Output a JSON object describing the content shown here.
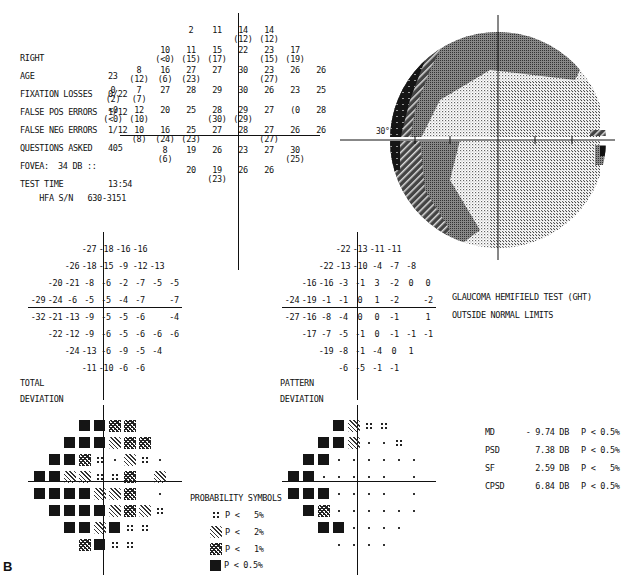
{
  "report": {
    "eye": "RIGHT",
    "figure_label": "B",
    "info": [
      {
        "label": "AGE",
        "value": "23"
      },
      {
        "label": "FIXATION LOSSES",
        "value": "0/22"
      },
      {
        "label": "FALSE POS ERRORS",
        "value": "1/12"
      },
      {
        "label": "FALSE NEG ERRORS",
        "value": "1/12"
      },
      {
        "label": "QUESTIONS ASKED",
        "value": "405"
      },
      {
        "label": "FOVEA:",
        "value": "34 DB ::"
      },
      {
        "label": "TEST TIME",
        "value": "13:54"
      }
    ],
    "serial": {
      "label": "HFA S/N",
      "value": "630-3151"
    }
  },
  "threshold": {
    "rows": [
      [
        null,
        null,
        null,
        {
          "v": "2"
        },
        {
          "v": "11"
        },
        {
          "v": "14",
          "r": "(12)"
        },
        {
          "v": "14",
          "r": "(12)"
        },
        null,
        null,
        null
      ],
      [
        null,
        null,
        {
          "v": "10",
          "r": "(<0)"
        },
        {
          "v": "11",
          "r": "(15)"
        },
        {
          "v": "15",
          "r": "(17)"
        },
        {
          "v": "22"
        },
        {
          "v": "23",
          "r": "(15)"
        },
        {
          "v": "17",
          "r": "(19)"
        },
        null,
        null
      ],
      [
        null,
        {
          "v": "8",
          "r": "(12)"
        },
        {
          "v": "16",
          "r": "(6)"
        },
        {
          "v": "27",
          "r": "(23)"
        },
        {
          "v": "27"
        },
        {
          "v": "30"
        },
        {
          "v": "23",
          "r": "(27)"
        },
        {
          "v": "26"
        },
        {
          "v": "26"
        },
        null
      ],
      [
        {
          "v": "0",
          "r": "(2)"
        },
        {
          "v": "7",
          "r": "(7)"
        },
        {
          "v": "27"
        },
        {
          "v": "28"
        },
        {
          "v": "29"
        },
        {
          "v": "30"
        },
        {
          "v": "26"
        },
        {
          "v": "23"
        },
        {
          "v": "25"
        },
        null
      ],
      [
        {
          "v": "<0",
          "r": "(<0)"
        },
        {
          "v": "12",
          "r": "(10)"
        },
        {
          "v": "20"
        },
        {
          "v": "25"
        },
        {
          "v": "28",
          "r": "(30)"
        },
        {
          "v": "29",
          "r": "(29)"
        },
        {
          "v": "27"
        },
        {
          "v": "(0"
        },
        {
          "v": "28"
        },
        null
      ],
      [
        null,
        {
          "v": "10",
          "r": "(8)"
        },
        {
          "v": "16",
          "r": "(24)"
        },
        {
          "v": "25",
          "r": "(23)"
        },
        {
          "v": "27"
        },
        {
          "v": "28"
        },
        {
          "v": "27",
          "r": "(27)"
        },
        {
          "v": "26"
        },
        {
          "v": "26"
        },
        null
      ],
      [
        null,
        null,
        {
          "v": "8",
          "r": "(6)"
        },
        {
          "v": "19"
        },
        {
          "v": "26"
        },
        {
          "v": "23"
        },
        {
          "v": "27"
        },
        {
          "v": "30",
          "r": "(25)"
        },
        null,
        null
      ],
      [
        null,
        null,
        null,
        {
          "v": "20"
        },
        {
          "v": "19",
          "r": "(23)"
        },
        {
          "v": "26"
        },
        {
          "v": "26"
        },
        null,
        null,
        null
      ]
    ]
  },
  "greyscale": {
    "degree_label": "30°"
  },
  "total_deviation": {
    "title_line1": "TOTAL",
    "title_line2": "DEVIATION",
    "rows": [
      [
        null,
        null,
        null,
        "-27",
        "-18",
        "-16",
        "-16",
        null,
        null
      ],
      [
        null,
        null,
        "-26",
        "-18",
        "-15",
        "-9",
        "-12",
        "-13",
        null
      ],
      [
        null,
        "-20",
        "-21",
        "-8",
        "-6",
        "-2",
        "-7",
        "-5",
        "-5"
      ],
      [
        "-29",
        "-24",
        "-6",
        "-5",
        "-5",
        "-4",
        "-7",
        null,
        "-7"
      ],
      [
        "-32",
        "-21",
        "-13",
        "-9",
        "-5",
        "-5",
        "-6",
        null,
        "-4"
      ],
      [
        null,
        "-22",
        "-12",
        "-9",
        "-6",
        "-5",
        "-6",
        "-6",
        "-6"
      ],
      [
        null,
        null,
        "-24",
        "-13",
        "-6",
        "-9",
        "-5",
        "-4",
        null
      ],
      [
        null,
        null,
        null,
        "-11",
        "-10",
        "-6",
        "-6",
        null,
        null
      ]
    ],
    "prob_rows": [
      [
        null,
        null,
        null,
        "s05",
        "s05",
        "s1",
        "s1",
        null,
        null
      ],
      [
        null,
        null,
        "s05",
        "s05",
        "s05",
        "s2",
        "s1",
        "s1",
        null
      ],
      [
        null,
        "s05",
        "s05",
        "s1",
        "s5",
        "sn",
        "s2",
        "s5",
        "sn"
      ],
      [
        "s05",
        "s05",
        "s2",
        "s2",
        "s5",
        "s5",
        "s1",
        null,
        "s2"
      ],
      [
        "s05",
        "s05",
        "s05",
        "s05",
        "s2",
        "s2",
        "s1",
        null,
        "sn"
      ],
      [
        null,
        "s05",
        "s05",
        "s05",
        "s05",
        "s2",
        "s1",
        "s2",
        "s5"
      ],
      [
        null,
        null,
        "s05",
        "s05",
        "s2",
        "s05",
        "s5",
        "s5",
        null
      ],
      [
        null,
        null,
        null,
        "s1",
        "s05",
        "s5",
        "s5",
        null,
        null
      ]
    ]
  },
  "pattern_deviation": {
    "title_line1": "PATTERN",
    "title_line2": "DEVIATION",
    "rows": [
      [
        null,
        null,
        null,
        "-22",
        "-13",
        "-11",
        "-11",
        null,
        null
      ],
      [
        null,
        null,
        "-22",
        "-13",
        "-10",
        "-4",
        "-7",
        "-8",
        null
      ],
      [
        null,
        "-16",
        "-16",
        "-3",
        "-1",
        "3",
        "-2",
        "0",
        "0"
      ],
      [
        "-24",
        "-19",
        "-1",
        "-1",
        "0",
        "1",
        "-2",
        null,
        "-2"
      ],
      [
        "-27",
        "-16",
        "-8",
        "-4",
        "0",
        "0",
        "-1",
        null,
        "1"
      ],
      [
        null,
        "-17",
        "-7",
        "-5",
        "-1",
        "0",
        "-1",
        "-1",
        "-1"
      ],
      [
        null,
        null,
        "-19",
        "-8",
        "-1",
        "-4",
        "0",
        "1",
        null
      ],
      [
        null,
        null,
        null,
        "-6",
        "-5",
        "-1",
        "-1",
        null,
        null
      ]
    ],
    "prob_rows": [
      [
        null,
        null,
        null,
        "s05",
        "s2",
        "s5",
        "s5",
        null,
        null
      ],
      [
        null,
        null,
        "s05",
        "s05",
        "s2",
        "sn",
        "sn",
        "s5",
        null
      ],
      [
        null,
        "s05",
        "s05",
        "sn",
        "sn",
        "sn",
        "sn",
        "sn",
        "sn"
      ],
      [
        "s05",
        "s05",
        "sn",
        "sn",
        "sn",
        "sn",
        "sn",
        null,
        "sn"
      ],
      [
        "s05",
        "s05",
        "s05",
        "sn",
        "sn",
        "sn",
        "sn",
        null,
        "sn"
      ],
      [
        null,
        "s05",
        "s1",
        "sn",
        "sn",
        "sn",
        "sn",
        "sn",
        "sn"
      ],
      [
        null,
        null,
        "s05",
        "s05",
        "sn",
        "sn",
        "sn",
        "sn",
        null
      ],
      [
        null,
        null,
        null,
        "sn",
        "sn",
        "sn",
        "sn",
        null,
        null
      ]
    ]
  },
  "ght": {
    "line1": "GLAUCOMA HEMIFIELD TEST (GHT)",
    "line2": "OUTSIDE NORMAL LIMITS"
  },
  "probability_legend": {
    "title": "PROBABILITY SYMBOLS",
    "items": [
      {
        "symbol": "s5",
        "text": "P <   5%"
      },
      {
        "symbol": "s2",
        "text": "P <   2%"
      },
      {
        "symbol": "s1",
        "text": "P <   1%"
      },
      {
        "symbol": "s05",
        "text": "P < 0.5%"
      }
    ]
  },
  "global_indices": [
    {
      "name": "MD",
      "value": "- 9.74 DB",
      "p": "P < 0.5%"
    },
    {
      "name": "PSD",
      "value": "7.38 DB",
      "p": "P < 0.5%"
    },
    {
      "name": "SF",
      "value": "2.59 DB",
      "p": "P <   5%"
    },
    {
      "name": "CPSD",
      "value": "6.84 DB",
      "p": "P < 0.5%"
    }
  ]
}
